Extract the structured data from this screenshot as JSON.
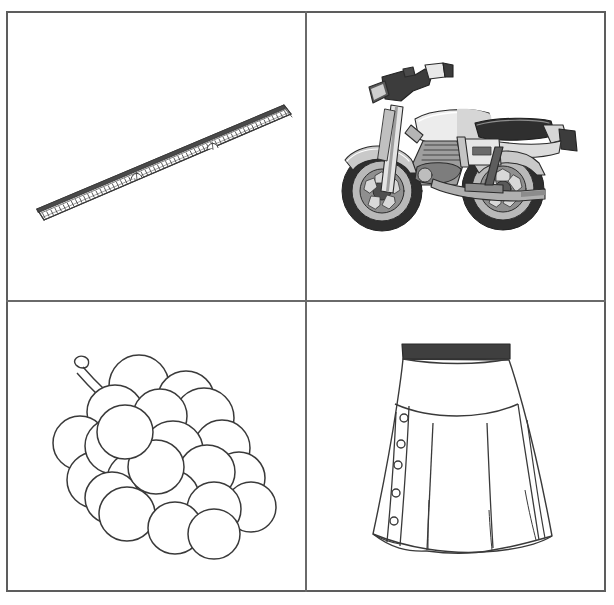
{
  "page": {
    "width": 614,
    "height": 605,
    "background_color": "#ffffff",
    "border_color": "#5d5d5d",
    "divider_color": "#6a6a6a",
    "layout": "2x2 grid of picture cards",
    "style": "black-and-white line-art / clip-art flashcards"
  },
  "cells": [
    {
      "position": "top-left",
      "subject": "ruler",
      "caption": "",
      "description": "A long straight ruler drawn in perspective, tilted diagonally from lower-left to upper-right, with graduation tick marks along its lower measuring edge and two small arched notches on its face.",
      "art_style": "outline line drawing",
      "stroke_color": "#3a3a3a",
      "fill_color": "#ffffff"
    },
    {
      "position": "top-right",
      "subject": "motorcycle",
      "caption": "",
      "description": "A classic street motorcycle in side view facing left, with mag-style spoked wheels, fuel tank, long seat, engine block, exhaust pipe, front forks and handlebars with mirrors.",
      "art_style": "grayscale shaded clip-art",
      "stroke_color": "#2b2b2b",
      "fill_color": "#c9c9c9",
      "accent_color": "#4a4a4a"
    },
    {
      "position": "bottom-left",
      "subject": "grapes",
      "caption": "",
      "description": "A bunch of grapes drawn as overlapping circles forming a cluster, with a curved cut stem extending from the upper-left of the bunch.",
      "art_style": "outline line drawing",
      "stroke_color": "#3a3a3a",
      "fill_color": "#ffffff"
    },
    {
      "position": "bottom-right",
      "subject": "skirt",
      "caption": "",
      "description": "A pleated A-line skirt viewed from the front, with a dark waistband, a curved yoke seam, a vertical button placket on the left with five small round buttons, and pleat fold lines flaring to a scalloped hem.",
      "art_style": "outline fashion technical drawing",
      "stroke_color": "#3a3a3a",
      "fill_color": "#ffffff",
      "waistband_color": "#3f3f3f",
      "button_count": 5
    }
  ]
}
